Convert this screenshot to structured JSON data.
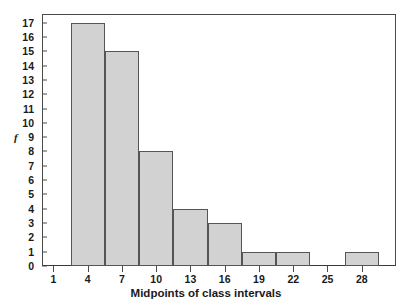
{
  "chart_data": {
    "type": "bar",
    "title": "",
    "subtitle": "",
    "xlabel": "Midpoints of class intervals",
    "ylabel": "f",
    "categories": [
      4,
      7,
      10,
      13,
      16,
      19,
      22,
      25,
      28
    ],
    "values": [
      17,
      15,
      8,
      4,
      3,
      1,
      1,
      0,
      1
    ],
    "bar_edges": [
      [
        2.5,
        5.5
      ],
      [
        5.5,
        8.5
      ],
      [
        8.5,
        11.5
      ],
      [
        11.5,
        14.5
      ],
      [
        14.5,
        17.5
      ],
      [
        17.5,
        20.5
      ],
      [
        20.5,
        23.5
      ],
      [
        23.5,
        26.5
      ],
      [
        26.5,
        29.5
      ]
    ],
    "class_width": 3,
    "xlim": [
      0,
      31
    ],
    "ylim": [
      0,
      17.6
    ],
    "x_ticks": [
      1,
      4,
      7,
      10,
      13,
      16,
      19,
      22,
      25,
      28
    ],
    "y_ticks": [
      0,
      1,
      2,
      3,
      4,
      5,
      6,
      7,
      8,
      9,
      10,
      11,
      12,
      13,
      14,
      15,
      16,
      17
    ],
    "grid": false,
    "legend": false,
    "legend_position": "none",
    "bar_fill_color": "#d2d2d2",
    "bar_border_color": "#555555",
    "axis_color": "#4a4a4a",
    "text_color": "#1a1a1a",
    "background_color": "#ffffff"
  }
}
